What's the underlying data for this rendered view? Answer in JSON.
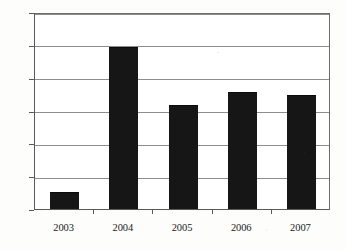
{
  "chart_data": {
    "type": "bar",
    "title": "",
    "subtitle": "",
    "xlabel": "",
    "ylabel": "",
    "categories": [
      "2003",
      "2004",
      "2005",
      "2006",
      "2007"
    ],
    "values": [
      24,
      245,
      157,
      177,
      172
    ],
    "series": [
      {
        "name": "",
        "values": [
          24,
          245,
          157,
          177,
          172
        ]
      }
    ],
    "ylim": [
      0,
      300
    ],
    "yticks": [
      0,
      50,
      100,
      150,
      200,
      250,
      300
    ],
    "ytick_labels": [
      "0",
      "50",
      "100",
      "150",
      "200",
      "250",
      "300"
    ],
    "grid": "horizontal",
    "legend": "none",
    "bar_color": "#161616",
    "gridline_color": "#8d8d8d",
    "axis_color": "#5a5a5a",
    "background": "#ffffff",
    "annotations": []
  }
}
